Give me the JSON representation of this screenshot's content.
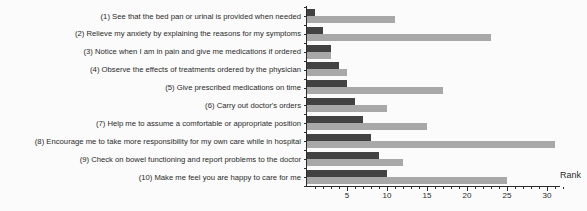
{
  "figure": {
    "background": "#fbfbfb",
    "axis_color": "#2b2b2b",
    "text_color": "#2a2a2a"
  },
  "chart_data": {
    "type": "bar",
    "orientation": "horizontal",
    "title": "",
    "xlabel": "Rank",
    "ylabel": "",
    "xlim": [
      0,
      32
    ],
    "x_major_ticks": [
      5,
      10,
      15,
      20,
      25,
      30
    ],
    "x_minor_tick_step": 1,
    "grid": false,
    "legend_position": "none",
    "categories": [
      "(1) See that the bed pan or urinal is provided when needed",
      "(2) Relieve my anxiety by explaining the reasons for my symptoms",
      "(3) Notice when I am in pain and give me medications if ordered",
      "(4) Observe the effects of treatments ordered by the physician",
      "(5) Give prescribed medications on time",
      "(6) Carry out doctor's orders",
      "(7) Help me to assume a comfortable or appropriate position",
      "(8) Encourage me to take more responsibility for my own care while in hospital",
      "(9) Check on bowel functioning and report problems to the doctor",
      "(10) Make me feel you are happy to care for me"
    ],
    "series": [
      {
        "name": "dark-gray-bars",
        "color": "#424242",
        "values": [
          1,
          2,
          3,
          4,
          5,
          6,
          7,
          8,
          9,
          10
        ]
      },
      {
        "name": "light-gray-bars",
        "color": "#a8a8a8",
        "values": [
          11,
          23,
          3,
          5,
          17,
          10,
          15,
          31,
          12,
          25
        ]
      }
    ]
  }
}
